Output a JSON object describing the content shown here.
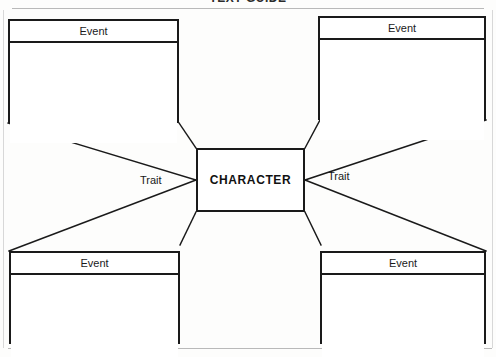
{
  "page": {
    "title": "TEXT GUIDE",
    "background_color": "#fdfdfc",
    "ink_color": "#1a1a1a",
    "width": 496,
    "height": 357
  },
  "diagram": {
    "type": "character-map-graphic-organizer",
    "center": {
      "label": "CHARACTER"
    },
    "traits": [
      {
        "id": "trait-left",
        "label": "Trait"
      },
      {
        "id": "trait-right",
        "label": "Trait"
      }
    ],
    "events": [
      {
        "id": "event-tl",
        "position": "top-left",
        "header": "Event",
        "body": ""
      },
      {
        "id": "event-tr",
        "position": "top-right",
        "header": "Event",
        "body": ""
      },
      {
        "id": "event-bl",
        "position": "bottom-left",
        "header": "Event",
        "body": ""
      },
      {
        "id": "event-br",
        "position": "bottom-right",
        "header": "Event",
        "body": ""
      }
    ]
  }
}
